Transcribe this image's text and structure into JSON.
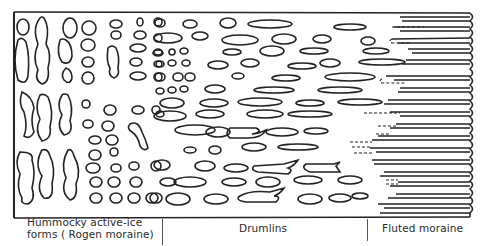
{
  "figure": {
    "type": "glacial-landform-continuum-diagram",
    "zones": [
      {
        "id": "hummocky",
        "label_line1": "Hummocky active-ice",
        "label_line2": "forms ( Rogen moraine)"
      },
      {
        "id": "drumlins",
        "label": "Drumlins"
      },
      {
        "id": "fluted",
        "label": "Fluted moraine"
      }
    ]
  },
  "colors": {
    "ink": "#222222",
    "background": "#ffffff"
  }
}
